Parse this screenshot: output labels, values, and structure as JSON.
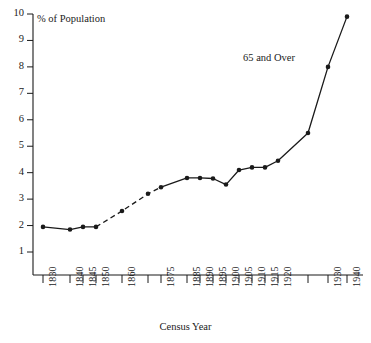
{
  "chart_data": {
    "type": "line",
    "title": "",
    "xlabel": "Census Year",
    "ylabel": "% of Population",
    "annotation": "65 and Over",
    "grid": false,
    "legend": "none",
    "ylim": [
      0,
      10
    ],
    "ytick_labels": [
      "10",
      "9",
      "8",
      "7",
      "6",
      "5",
      "4",
      "3",
      "2",
      "1"
    ],
    "ytick_values": [
      10,
      9,
      8,
      7,
      6,
      5,
      4,
      3,
      2,
      1
    ],
    "xtick_labels": [
      "1830",
      "1840",
      "1845",
      "1850",
      "1860",
      "",
      "1875",
      "1885",
      "1890",
      "1895",
      "1900",
      "1905",
      "1910",
      "1915",
      "1920",
      "",
      "1930",
      "1940",
      "1950"
    ],
    "x": [
      1830,
      1840,
      1845,
      1850,
      1860,
      1870,
      1875,
      1885,
      1890,
      1895,
      1900,
      1905,
      1910,
      1915,
      1920,
      1930,
      1940,
      1950
    ],
    "values": [
      1.95,
      1.85,
      1.95,
      1.95,
      2.55,
      3.2,
      3.45,
      3.8,
      3.8,
      3.78,
      3.55,
      4.1,
      4.2,
      4.2,
      4.45,
      5.5,
      8.0,
      9.9
    ],
    "segments": [
      {
        "style": "solid",
        "from": 1830,
        "to": 1850
      },
      {
        "style": "dashed",
        "from": 1850,
        "to": 1875
      },
      {
        "style": "solid",
        "from": 1875,
        "to": 1950
      }
    ],
    "series": [
      {
        "name": "65 and Over",
        "values": [
          1.95,
          1.85,
          1.95,
          1.95,
          2.55,
          3.2,
          3.45,
          3.8,
          3.8,
          3.78,
          3.55,
          4.1,
          4.2,
          4.2,
          4.45,
          5.5,
          8.0,
          9.9
        ]
      }
    ],
    "marker": "filled-circle",
    "line_color": "#1a1a1a"
  }
}
